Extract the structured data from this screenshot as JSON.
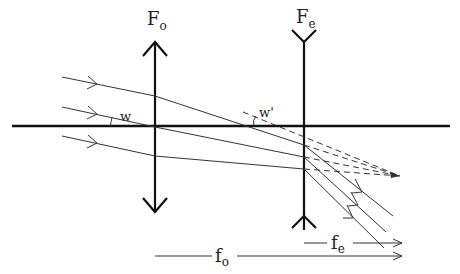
{
  "diagram": {
    "type": "ray diagram",
    "labels": {
      "objective": "F",
      "objective_sub": "o",
      "eyepiece": "F",
      "eyepiece_sub": "e",
      "angle_in": "w",
      "angle_out": "w'",
      "focal_objective": "f",
      "focal_objective_sub": "o",
      "focal_eyepiece": "f",
      "focal_eyepiece_sub": "e"
    },
    "elements": [
      {
        "name": "optical-axis",
        "kind": "horizontal line"
      },
      {
        "name": "objective-lens",
        "kind": "converging lens (double-arrow)",
        "label": "Fo"
      },
      {
        "name": "eyepiece-lens",
        "kind": "diverging lens (inverted-arrow ends)",
        "label": "Fe"
      },
      {
        "name": "incident-rays",
        "count": 3,
        "style": "solid, with arrowheads"
      },
      {
        "name": "emergent-rays",
        "count": 3,
        "style": "solid, parallel, with arrowheads"
      },
      {
        "name": "virtual-extensions",
        "count": 3,
        "style": "dashed, converging to focal point"
      },
      {
        "name": "focal-length-fo",
        "kind": "dimension arrow"
      },
      {
        "name": "focal-length-fe",
        "kind": "dimension arrow"
      }
    ]
  }
}
